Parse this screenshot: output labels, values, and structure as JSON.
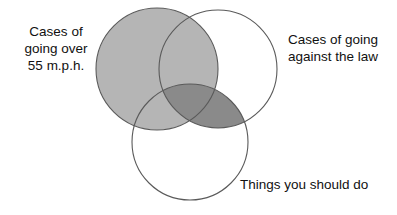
{
  "diagram": {
    "type": "venn",
    "title": "",
    "background_color": "#ffffff",
    "stroke_color": "#5a5a5a",
    "fill_light": "#b5b5b5",
    "fill_dark": "#8a8a8a",
    "fill_none": "#ffffff",
    "sets": [
      {
        "id": "speeding",
        "label": "Cases of\ngoing over\n55 m.p.h.",
        "label_lines": [
          "Cases of",
          "going over",
          "55 m.p.h."
        ],
        "position": "top-left",
        "center": [
          157,
          69
        ],
        "radius": 61,
        "fill": "#b5b5b5"
      },
      {
        "id": "illegal",
        "label": "Cases of going\nagainst the law",
        "label_lines": [
          "Cases of going",
          "against the law"
        ],
        "position": "top-right",
        "center": [
          218,
          69
        ],
        "radius": 59,
        "fill": "#ffffff"
      },
      {
        "id": "should_do",
        "label": "Things you should do",
        "label_lines": [
          "Things you should do"
        ],
        "position": "bottom-center",
        "center": [
          190,
          142
        ],
        "radius": 58,
        "fill": "#ffffff"
      }
    ],
    "shaded_regions": [
      {
        "id": "speeding-only-and-overlaps",
        "sets": [
          "speeding"
        ],
        "shade": "light",
        "color": "#b5b5b5"
      },
      {
        "id": "illegal-and-should-do",
        "sets": [
          "illegal",
          "should_do"
        ],
        "shade": "dark",
        "color": "#8a8a8a"
      }
    ]
  },
  "labels": {
    "speeding": "Cases of\ngoing over\n55 m.p.h.",
    "illegal": "Cases of going\nagainst the law",
    "should_do": "Things you should do"
  }
}
